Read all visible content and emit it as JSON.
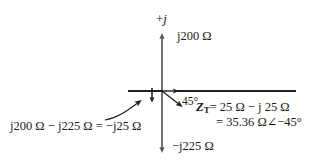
{
  "figure": {
    "type": "phasor-diagram",
    "axes": {
      "imaginary_axis_label": "+j",
      "imaginary_positive_tip_label": "j200 Ω",
      "imaginary_negative_tip_label": "−j225 Ω"
    },
    "angle_label": "45°",
    "reactance_sum": {
      "text": "j200 Ω − j225 Ω = −j25 Ω",
      "terms": [
        "j200 Ω",
        "−",
        "j225 Ω",
        "=",
        "−j25 Ω"
      ]
    },
    "total_impedance": {
      "line1_symbol": "Z",
      "line1_subscript": "T",
      "line1_value": "= 25 Ω − j 25 Ω",
      "line2_value": "= 35.36 Ω∠−45°"
    },
    "colors": {
      "stroke_dark": "#231f20",
      "stroke_axis": "#58585b",
      "background": "#ffffff",
      "text": "#1a1a1a"
    },
    "vectors": [
      {
        "name": "imaginary-axis-up",
        "from": [
          162,
          150
        ],
        "to": [
          162,
          33
        ],
        "label": "j200 Ω"
      },
      {
        "name": "imaginary-axis-down",
        "from": [
          162,
          33
        ],
        "to": [
          162,
          150
        ],
        "label": "−j225 Ω"
      },
      {
        "name": "resultant-reactance",
        "from": [
          152,
          91
        ],
        "to": [
          152,
          104
        ],
        "label": "−j25 Ω"
      },
      {
        "name": "resistance-vector",
        "from": [
          162,
          91
        ],
        "to": [
          180,
          91
        ],
        "label": "25 Ω"
      },
      {
        "name": "impedance-vector",
        "from": [
          162,
          91
        ],
        "to": [
          183,
          108
        ],
        "label": "Z_T at −45°"
      }
    ]
  }
}
